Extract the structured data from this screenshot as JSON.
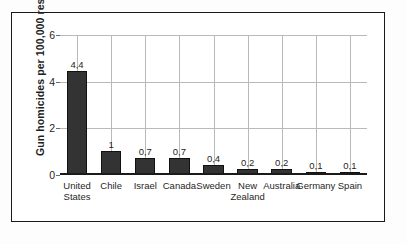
{
  "chart_data": {
    "type": "bar",
    "title": "",
    "subtitle": "",
    "xlabel": "",
    "ylabel": "Gun homicides per 100,000 residents",
    "ylim": [
      0,
      6
    ],
    "yticks": [
      0,
      2,
      4,
      6
    ],
    "ytick_labels": [
      "0",
      "2",
      "4",
      "6"
    ],
    "grid": true,
    "legend": "none",
    "categories": [
      "United States",
      "Chile",
      "Israel",
      "Canada",
      "Sweden",
      "New Zealand",
      "Australia",
      "Germany",
      "Spain"
    ],
    "category_lines": [
      [
        "United",
        "States"
      ],
      [
        "Chile",
        ""
      ],
      [
        "Israel",
        ""
      ],
      [
        "Canada",
        ""
      ],
      [
        "Sweden",
        ""
      ],
      [
        "New",
        "Zealand"
      ],
      [
        "Australia",
        ""
      ],
      [
        "Germany",
        ""
      ],
      [
        "Spain",
        ""
      ]
    ],
    "values": [
      4.4,
      1,
      0.7,
      0.7,
      0.4,
      0.2,
      0.2,
      0.1,
      0.1
    ],
    "value_labels": [
      "4,4",
      "1",
      "0,7",
      "0,7",
      "0,4",
      "0,2",
      "0,2",
      "0,1",
      "0,1"
    ],
    "colors": {
      "bar": "#333333",
      "bar_edge": "#111111",
      "grid": "#b9b9b9",
      "axis": "#1a1a1a",
      "text": "#1f1f1f",
      "frame": "#1a1a1a",
      "background": "#ffffff"
    }
  }
}
